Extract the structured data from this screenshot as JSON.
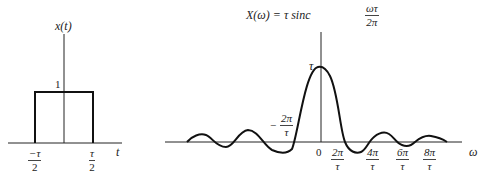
{
  "left_plot": {
    "y_label": "x(t)",
    "x_label": "t",
    "height_label": "1",
    "left_tick": {
      "num": "−τ",
      "den": "2"
    },
    "right_tick": {
      "num": "τ",
      "den": "2"
    }
  },
  "right_plot": {
    "title_prefix": "X(ω) = τ sinc",
    "title_frac": {
      "num": "ωτ",
      "den": "2π"
    },
    "x_label": "ω",
    "peak_label": "τ",
    "origin_label": "0",
    "neg_tick": {
      "sign": "−",
      "num": "2π",
      "den": "τ"
    },
    "ticks": [
      {
        "num": "2π",
        "den": "τ"
      },
      {
        "num": "4π",
        "den": "τ"
      },
      {
        "num": "6π",
        "den": "τ"
      },
      {
        "num": "8π",
        "den": "τ"
      }
    ]
  },
  "colors": {
    "line": "#111111",
    "text": "#222222",
    "background": "#ffffff"
  }
}
